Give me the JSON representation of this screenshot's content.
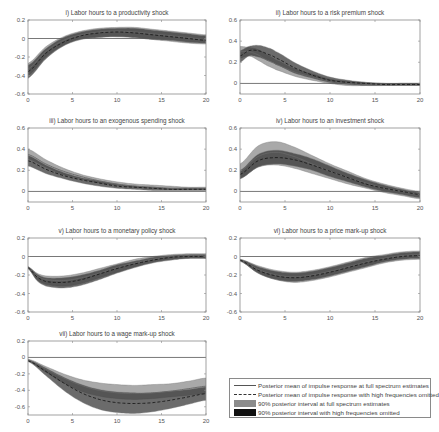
{
  "figure": {
    "panels": [
      {
        "id": "i",
        "title": "i) Labor hours to a productivity shock",
        "ylim": [
          -0.6,
          0.2
        ],
        "yticks": [
          "0.2",
          "0",
          "-0.2",
          "-0.4",
          "-0.6"
        ],
        "ytick_vals": [
          0.2,
          0,
          -0.2,
          -0.4,
          -0.6
        ]
      },
      {
        "id": "ii",
        "title": "ii) Labor hours to a risk premium shock",
        "ylim": [
          -0.1,
          0.6
        ],
        "yticks": [
          "0.6",
          "0.4",
          "0.2",
          "0"
        ],
        "ytick_vals": [
          0.6,
          0.4,
          0.2,
          0
        ]
      },
      {
        "id": "iii",
        "title": "iii) Labor hours to an exogenous spending shock",
        "ylim": [
          -0.1,
          0.6
        ],
        "yticks": [
          "0.6",
          "0.4",
          "0.2",
          "0"
        ],
        "ytick_vals": [
          0.6,
          0.4,
          0.2,
          0
        ]
      },
      {
        "id": "iv",
        "title": "iv) Labor hours to an investment shock",
        "ylim": [
          -0.1,
          0.6
        ],
        "yticks": [
          "0.6",
          "0.4",
          "0.2",
          "0"
        ],
        "ytick_vals": [
          0.6,
          0.4,
          0.2,
          0
        ]
      },
      {
        "id": "v",
        "title": "v) Labor hours to a monetary policy shock",
        "ylim": [
          -0.6,
          0.2
        ],
        "yticks": [
          "0.2",
          "0",
          "-0.2",
          "-0.4",
          "-0.6"
        ],
        "ytick_vals": [
          0.2,
          0,
          -0.2,
          -0.4,
          -0.6
        ]
      },
      {
        "id": "vi",
        "title": "vi) Labor hours to a price mark-up shock",
        "ylim": [
          -0.6,
          0.2
        ],
        "yticks": [
          "0.2",
          "0",
          "-0.2",
          "-0.4",
          "-0.6"
        ],
        "ytick_vals": [
          0.2,
          0,
          -0.2,
          -0.4,
          -0.6
        ]
      },
      {
        "id": "vii",
        "title": "vii) Labor hours to a wage mark-up shock",
        "ylim": [
          -0.7,
          0.2
        ],
        "yticks": [
          "0.2",
          "0",
          "-0.2",
          "-0.4",
          "-0.6"
        ],
        "ytick_vals": [
          0.2,
          0,
          -0.2,
          -0.4,
          -0.6
        ]
      }
    ],
    "xticks": [
      "0",
      "5",
      "10",
      "15",
      "20"
    ],
    "legend": {
      "items": [
        {
          "label": "Posterior mean of impulse response at full spectrum estimates",
          "style": "solid-line"
        },
        {
          "label": "Posterior mean of impulse response with high frequencies omitted",
          "style": "dashed-line"
        },
        {
          "label": "90% posterior interval at full spectrum estimates",
          "style": "gray-fill"
        },
        {
          "label": "90% posterior interval with high frequencies omitted",
          "style": "black-fill"
        }
      ]
    },
    "colors": {
      "band_full": "#9a9a9a",
      "band_omit": "#3a3a3a",
      "axis": "#8a8a8a",
      "zero_line": "#555555"
    }
  },
  "chart_data": [
    {
      "type": "area",
      "title": "i) Labor hours to a productivity shock",
      "xlabel": "",
      "ylabel": "",
      "x": [
        0,
        2,
        4,
        6,
        8,
        10,
        12,
        14,
        16,
        18,
        20
      ],
      "ylim": [
        -0.6,
        0.2
      ],
      "xlim": [
        0,
        20
      ],
      "grid": false,
      "series": [
        {
          "name": "Posterior mean (full spectrum)",
          "values": [
            -0.33,
            -0.14,
            -0.02,
            0.04,
            0.07,
            0.08,
            0.07,
            0.05,
            0.03,
            0.01,
            -0.01
          ]
        },
        {
          "name": "Posterior mean (high freq. omitted)",
          "values": [
            -0.36,
            -0.16,
            -0.04,
            0.03,
            0.06,
            0.07,
            0.06,
            0.04,
            0.02,
            0.0,
            -0.02
          ]
        },
        {
          "name": "90% interval full lower",
          "values": [
            -0.4,
            -0.2,
            -0.07,
            0.0,
            0.02,
            0.02,
            0.01,
            -0.01,
            -0.03,
            -0.05,
            -0.06
          ]
        },
        {
          "name": "90% interval full upper",
          "values": [
            -0.27,
            -0.09,
            0.02,
            0.08,
            0.11,
            0.12,
            0.12,
            0.1,
            0.08,
            0.06,
            0.04
          ]
        },
        {
          "name": "90% interval omitted lower",
          "values": [
            -0.43,
            -0.22,
            -0.08,
            -0.01,
            0.01,
            0.02,
            0.01,
            -0.01,
            -0.02,
            -0.04,
            -0.05
          ]
        },
        {
          "name": "90% interval omitted upper",
          "values": [
            -0.29,
            -0.11,
            0.01,
            0.07,
            0.1,
            0.11,
            0.11,
            0.09,
            0.07,
            0.05,
            0.03
          ]
        }
      ]
    },
    {
      "type": "area",
      "title": "ii) Labor hours to a risk premium shock",
      "xlabel": "",
      "ylabel": "",
      "x": [
        0,
        1,
        2,
        3,
        4,
        6,
        8,
        10,
        12,
        14,
        16,
        18,
        20
      ],
      "ylim": [
        -0.1,
        0.6
      ],
      "xlim": [
        0,
        20
      ],
      "grid": false,
      "series": [
        {
          "name": "Posterior mean (full spectrum)",
          "values": [
            0.3,
            0.3,
            0.27,
            0.22,
            0.18,
            0.11,
            0.06,
            0.02,
            0.0,
            -0.01,
            -0.01,
            -0.01,
            -0.01
          ]
        },
        {
          "name": "Posterior mean (high freq. omitted)",
          "values": [
            0.26,
            0.31,
            0.31,
            0.28,
            0.24,
            0.15,
            0.08,
            0.03,
            0.01,
            0.0,
            -0.01,
            -0.01,
            -0.01
          ]
        },
        {
          "name": "90% interval full lower",
          "values": [
            0.24,
            0.26,
            0.22,
            0.17,
            0.13,
            0.07,
            0.03,
            0.0,
            -0.02,
            -0.02,
            -0.02,
            -0.02,
            -0.02
          ]
        },
        {
          "name": "90% interval full upper",
          "values": [
            0.35,
            0.34,
            0.32,
            0.27,
            0.22,
            0.14,
            0.09,
            0.04,
            0.02,
            0.01,
            0.0,
            0.0,
            0.0
          ]
        },
        {
          "name": "90% interval omitted lower",
          "values": [
            0.2,
            0.26,
            0.25,
            0.22,
            0.18,
            0.1,
            0.05,
            0.01,
            -0.01,
            -0.02,
            -0.02,
            -0.02,
            -0.02
          ]
        },
        {
          "name": "90% interval omitted upper",
          "values": [
            0.31,
            0.35,
            0.36,
            0.34,
            0.3,
            0.2,
            0.12,
            0.06,
            0.03,
            0.01,
            0.0,
            0.0,
            0.0
          ]
        }
      ]
    },
    {
      "type": "area",
      "title": "iii) Labor hours to an exogenous spending shock",
      "xlabel": "",
      "ylabel": "",
      "x": [
        0,
        2,
        4,
        6,
        8,
        10,
        12,
        14,
        16,
        18,
        20
      ],
      "ylim": [
        -0.1,
        0.6
      ],
      "xlim": [
        0,
        20
      ],
      "grid": false,
      "series": [
        {
          "name": "Posterior mean (full spectrum)",
          "values": [
            0.35,
            0.26,
            0.19,
            0.14,
            0.1,
            0.07,
            0.05,
            0.04,
            0.03,
            0.03,
            0.03
          ]
        },
        {
          "name": "Posterior mean (high freq. omitted)",
          "values": [
            0.29,
            0.21,
            0.15,
            0.11,
            0.08,
            0.05,
            0.04,
            0.03,
            0.02,
            0.02,
            0.02
          ]
        },
        {
          "name": "90% interval full lower",
          "values": [
            0.31,
            0.23,
            0.16,
            0.12,
            0.08,
            0.06,
            0.04,
            0.03,
            0.02,
            0.02,
            0.02
          ]
        },
        {
          "name": "90% interval full upper",
          "values": [
            0.4,
            0.3,
            0.22,
            0.16,
            0.12,
            0.09,
            0.07,
            0.06,
            0.05,
            0.04,
            0.04
          ]
        },
        {
          "name": "90% interval omitted lower",
          "values": [
            0.24,
            0.17,
            0.12,
            0.08,
            0.05,
            0.03,
            0.02,
            0.01,
            0.01,
            0.01,
            0.01
          ]
        },
        {
          "name": "90% interval omitted upper",
          "values": [
            0.34,
            0.25,
            0.18,
            0.13,
            0.1,
            0.07,
            0.05,
            0.04,
            0.03,
            0.03,
            0.03
          ]
        }
      ]
    },
    {
      "type": "area",
      "title": "iv) Labor hours to an investment shock",
      "xlabel": "",
      "ylabel": "",
      "x": [
        0,
        2,
        4,
        6,
        8,
        10,
        12,
        14,
        16,
        18,
        20
      ],
      "ylim": [
        -0.1,
        0.6
      ],
      "xlim": [
        0,
        20
      ],
      "grid": false,
      "series": [
        {
          "name": "Posterior mean (full spectrum)",
          "values": [
            0.19,
            0.33,
            0.37,
            0.33,
            0.26,
            0.19,
            0.13,
            0.08,
            0.03,
            0.0,
            -0.03
          ]
        },
        {
          "name": "Posterior mean (high freq. omitted)",
          "values": [
            0.16,
            0.29,
            0.32,
            0.3,
            0.25,
            0.19,
            0.13,
            0.07,
            0.03,
            0.0,
            -0.03
          ]
        },
        {
          "name": "90% interval full lower",
          "values": [
            0.12,
            0.23,
            0.25,
            0.22,
            0.17,
            0.12,
            0.07,
            0.03,
            -0.01,
            -0.04,
            -0.07
          ]
        },
        {
          "name": "90% interval full upper",
          "values": [
            0.26,
            0.43,
            0.47,
            0.42,
            0.34,
            0.26,
            0.19,
            0.12,
            0.07,
            0.03,
            0.0
          ]
        },
        {
          "name": "90% interval omitted lower",
          "values": [
            0.12,
            0.23,
            0.26,
            0.24,
            0.2,
            0.14,
            0.09,
            0.04,
            0.0,
            -0.03,
            -0.06
          ]
        },
        {
          "name": "90% interval omitted upper",
          "values": [
            0.2,
            0.35,
            0.39,
            0.36,
            0.31,
            0.24,
            0.17,
            0.11,
            0.06,
            0.02,
            -0.01
          ]
        }
      ]
    },
    {
      "type": "area",
      "title": "v) Labor hours to a monetary policy shock",
      "xlabel": "",
      "ylabel": "",
      "x": [
        0,
        1,
        2,
        4,
        6,
        8,
        10,
        12,
        14,
        16,
        18,
        20
      ],
      "ylim": [
        -0.6,
        0.2
      ],
      "xlim": [
        0,
        20
      ],
      "grid": false,
      "series": [
        {
          "name": "Posterior mean (full spectrum)",
          "values": [
            -0.12,
            -0.21,
            -0.25,
            -0.26,
            -0.23,
            -0.18,
            -0.12,
            -0.07,
            -0.03,
            0.0,
            0.01,
            0.01
          ]
        },
        {
          "name": "Posterior mean (high freq. omitted)",
          "values": [
            -0.12,
            -0.22,
            -0.27,
            -0.28,
            -0.25,
            -0.19,
            -0.13,
            -0.08,
            -0.04,
            -0.01,
            0.0,
            0.0
          ]
        },
        {
          "name": "90% interval full lower",
          "values": [
            -0.13,
            -0.25,
            -0.3,
            -0.32,
            -0.29,
            -0.23,
            -0.17,
            -0.11,
            -0.06,
            -0.03,
            -0.02,
            -0.02
          ]
        },
        {
          "name": "90% interval full upper",
          "values": [
            -0.11,
            -0.18,
            -0.21,
            -0.21,
            -0.18,
            -0.13,
            -0.08,
            -0.03,
            0.0,
            0.02,
            0.03,
            0.03
          ]
        },
        {
          "name": "90% interval omitted lower",
          "values": [
            -0.13,
            -0.26,
            -0.32,
            -0.34,
            -0.31,
            -0.25,
            -0.18,
            -0.12,
            -0.07,
            -0.04,
            -0.02,
            -0.02
          ]
        },
        {
          "name": "90% interval omitted upper",
          "values": [
            -0.11,
            -0.19,
            -0.23,
            -0.23,
            -0.2,
            -0.15,
            -0.09,
            -0.05,
            -0.01,
            0.01,
            0.02,
            0.02
          ]
        }
      ]
    },
    {
      "type": "area",
      "title": "vi) Labor hours to a price mark-up shock",
      "xlabel": "",
      "ylabel": "",
      "x": [
        0,
        2,
        4,
        6,
        8,
        10,
        12,
        14,
        16,
        18,
        20
      ],
      "ylim": [
        -0.6,
        0.2
      ],
      "xlim": [
        0,
        20
      ],
      "grid": false,
      "series": [
        {
          "name": "Posterior mean (full spectrum)",
          "values": [
            -0.04,
            -0.14,
            -0.2,
            -0.22,
            -0.2,
            -0.16,
            -0.11,
            -0.06,
            -0.02,
            0.01,
            0.02
          ]
        },
        {
          "name": "Posterior mean (high freq. omitted)",
          "values": [
            -0.04,
            -0.15,
            -0.21,
            -0.23,
            -0.21,
            -0.17,
            -0.12,
            -0.07,
            -0.03,
            0.0,
            0.01
          ]
        },
        {
          "name": "90% interval full lower",
          "values": [
            -0.05,
            -0.18,
            -0.25,
            -0.28,
            -0.26,
            -0.22,
            -0.17,
            -0.12,
            -0.07,
            -0.04,
            -0.03
          ]
        },
        {
          "name": "90% interval full upper",
          "values": [
            -0.03,
            -0.1,
            -0.15,
            -0.17,
            -0.15,
            -0.11,
            -0.06,
            -0.01,
            0.02,
            0.05,
            0.06
          ]
        },
        {
          "name": "90% interval omitted lower",
          "values": [
            -0.05,
            -0.18,
            -0.25,
            -0.27,
            -0.25,
            -0.21,
            -0.16,
            -0.11,
            -0.06,
            -0.03,
            -0.02
          ]
        },
        {
          "name": "90% interval omitted upper",
          "values": [
            -0.03,
            -0.11,
            -0.16,
            -0.18,
            -0.16,
            -0.12,
            -0.07,
            -0.02,
            0.01,
            0.04,
            0.05
          ]
        }
      ]
    },
    {
      "type": "area",
      "title": "vii) Labor hours to a wage mark-up shock",
      "xlabel": "",
      "ylabel": "",
      "x": [
        0,
        2,
        4,
        6,
        8,
        10,
        12,
        14,
        16,
        18,
        20
      ],
      "ylim": [
        -0.7,
        0.2
      ],
      "xlim": [
        0,
        20
      ],
      "grid": false,
      "series": [
        {
          "name": "Posterior mean (full spectrum)",
          "values": [
            -0.03,
            -0.14,
            -0.25,
            -0.34,
            -0.4,
            -0.43,
            -0.44,
            -0.43,
            -0.41,
            -0.38,
            -0.35
          ]
        },
        {
          "name": "Posterior mean (high freq. omitted)",
          "values": [
            -0.04,
            -0.17,
            -0.31,
            -0.43,
            -0.51,
            -0.55,
            -0.56,
            -0.55,
            -0.52,
            -0.48,
            -0.44
          ]
        },
        {
          "name": "90% interval full lower",
          "values": [
            -0.04,
            -0.18,
            -0.31,
            -0.41,
            -0.47,
            -0.5,
            -0.51,
            -0.5,
            -0.48,
            -0.46,
            -0.44
          ]
        },
        {
          "name": "90% interval full upper",
          "values": [
            -0.02,
            -0.11,
            -0.2,
            -0.27,
            -0.31,
            -0.33,
            -0.34,
            -0.33,
            -0.32,
            -0.29,
            -0.25
          ]
        },
        {
          "name": "90% interval omitted lower",
          "values": [
            -0.05,
            -0.22,
            -0.4,
            -0.54,
            -0.63,
            -0.67,
            -0.68,
            -0.66,
            -0.62,
            -0.57,
            -0.52
          ]
        },
        {
          "name": "90% interval omitted upper",
          "values": [
            -0.03,
            -0.13,
            -0.24,
            -0.33,
            -0.39,
            -0.42,
            -0.43,
            -0.43,
            -0.41,
            -0.39,
            -0.36
          ]
        }
      ]
    }
  ]
}
